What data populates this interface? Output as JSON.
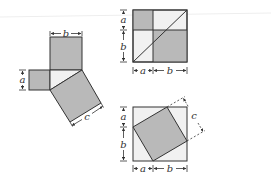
{
  "diagram": {
    "type": "pythagorean-theorem-proof",
    "colors": {
      "dark_fill": "#b9b9b9",
      "light_fill": "#f1f1f1",
      "stroke": "#333333",
      "background": "#ffffff"
    },
    "figure_left": {
      "description": "Right triangle with squares on each side",
      "labels": {
        "a": "a",
        "b": "b",
        "c": "c"
      }
    },
    "figure_top_right": {
      "description": "Square of side a+b split into a², b² and two rectangles with diagonals",
      "labels": {
        "left_a": "a",
        "left_b": "b",
        "bottom_a": "a",
        "bottom_b": "b"
      }
    },
    "figure_bottom_right": {
      "description": "Square of side a+b containing tilted c² square and four triangles",
      "labels": {
        "left_a": "a",
        "left_b": "b",
        "bottom_a": "a",
        "bottom_b": "b",
        "c": "c"
      }
    }
  }
}
